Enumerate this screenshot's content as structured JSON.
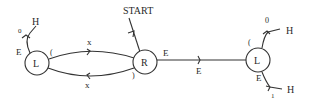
{
  "diagram": {
    "type": "state-diagram",
    "start_label": "START",
    "nodes": [
      {
        "id": "L1",
        "label": "L"
      },
      {
        "id": "R",
        "label": "R"
      },
      {
        "id": "L2",
        "label": "L"
      }
    ],
    "edges": [
      {
        "from": "L1",
        "to": "R",
        "label": "x",
        "end_labels": [
          "(",
          ""
        ]
      },
      {
        "from": "R",
        "to": "L1",
        "label": "x",
        "end_labels": [
          ")",
          ""
        ]
      },
      {
        "from": "R",
        "to": "L2",
        "label": "E",
        "end_labels": [
          "E",
          ""
        ]
      },
      {
        "from": "L1",
        "to": "H",
        "label": "0",
        "end_labels": [
          "E",
          "H"
        ]
      },
      {
        "from": "L2",
        "to": "H",
        "label": "0",
        "end_labels": [
          "(",
          "H"
        ]
      },
      {
        "from": "L2",
        "to": "H",
        "label": "1",
        "end_labels": [
          "E",
          "H"
        ]
      }
    ],
    "labels": {
      "start": "START",
      "l1": "L",
      "r": "R",
      "l2": "L",
      "l1_h": "H",
      "l1_h_zero": "0",
      "l1_e": "E",
      "l1_paren_open": "(",
      "top_x": "x",
      "bottom_x": "x",
      "r_paren_close": ")",
      "r_e": "E",
      "mid_e": "E",
      "l2_paren_open": "(",
      "l2_h_top": "H",
      "l2_zero": "0",
      "l2_e": "E",
      "l2_one": "1",
      "l2_h_bottom": "H"
    }
  }
}
